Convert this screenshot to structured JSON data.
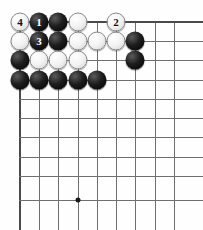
{
  "board": {
    "kind": "go-board-diagram",
    "view": "top-left-corner",
    "width": 203,
    "height": 230,
    "grid": {
      "columns": 9,
      "rows": 10,
      "x_positions": [
        20,
        39,
        58,
        78,
        97,
        116,
        135,
        155,
        174
      ],
      "y_positions": [
        22,
        41,
        60,
        80,
        99,
        118,
        137,
        157,
        176,
        200
      ],
      "line_color": "#6f6f6f",
      "edge_color": "#4a4a4a",
      "background_color": "#fefefe",
      "right_overhang": 29,
      "bottom_overhang": 30
    },
    "star_points": [
      {
        "col": 4,
        "row": 10
      }
    ],
    "stones": [
      {
        "col": 1,
        "row": 1,
        "color": "white",
        "label": "4"
      },
      {
        "col": 2,
        "row": 1,
        "color": "black",
        "label": "1"
      },
      {
        "col": 3,
        "row": 1,
        "color": "black",
        "label": ""
      },
      {
        "col": 4,
        "row": 1,
        "color": "white",
        "label": ""
      },
      {
        "col": 6,
        "row": 1,
        "color": "white",
        "label": "2"
      },
      {
        "col": 1,
        "row": 2,
        "color": "white",
        "label": ""
      },
      {
        "col": 2,
        "row": 2,
        "color": "black",
        "label": "3"
      },
      {
        "col": 3,
        "row": 2,
        "color": "black",
        "label": ""
      },
      {
        "col": 4,
        "row": 2,
        "color": "white",
        "label": ""
      },
      {
        "col": 5,
        "row": 2,
        "color": "white",
        "label": ""
      },
      {
        "col": 6,
        "row": 2,
        "color": "white",
        "label": ""
      },
      {
        "col": 7,
        "row": 2,
        "color": "black",
        "label": ""
      },
      {
        "col": 1,
        "row": 3,
        "color": "black",
        "label": ""
      },
      {
        "col": 2,
        "row": 3,
        "color": "white",
        "label": ""
      },
      {
        "col": 3,
        "row": 3,
        "color": "white",
        "label": ""
      },
      {
        "col": 4,
        "row": 3,
        "color": "white",
        "label": ""
      },
      {
        "col": 7,
        "row": 3,
        "color": "black",
        "label": ""
      },
      {
        "col": 1,
        "row": 4,
        "color": "black",
        "label": ""
      },
      {
        "col": 2,
        "row": 4,
        "color": "black",
        "label": ""
      },
      {
        "col": 3,
        "row": 4,
        "color": "black",
        "label": ""
      },
      {
        "col": 4,
        "row": 4,
        "color": "black",
        "label": ""
      },
      {
        "col": 5,
        "row": 4,
        "color": "black",
        "label": ""
      }
    ],
    "move_labels": [
      "1",
      "2",
      "3",
      "4"
    ]
  }
}
